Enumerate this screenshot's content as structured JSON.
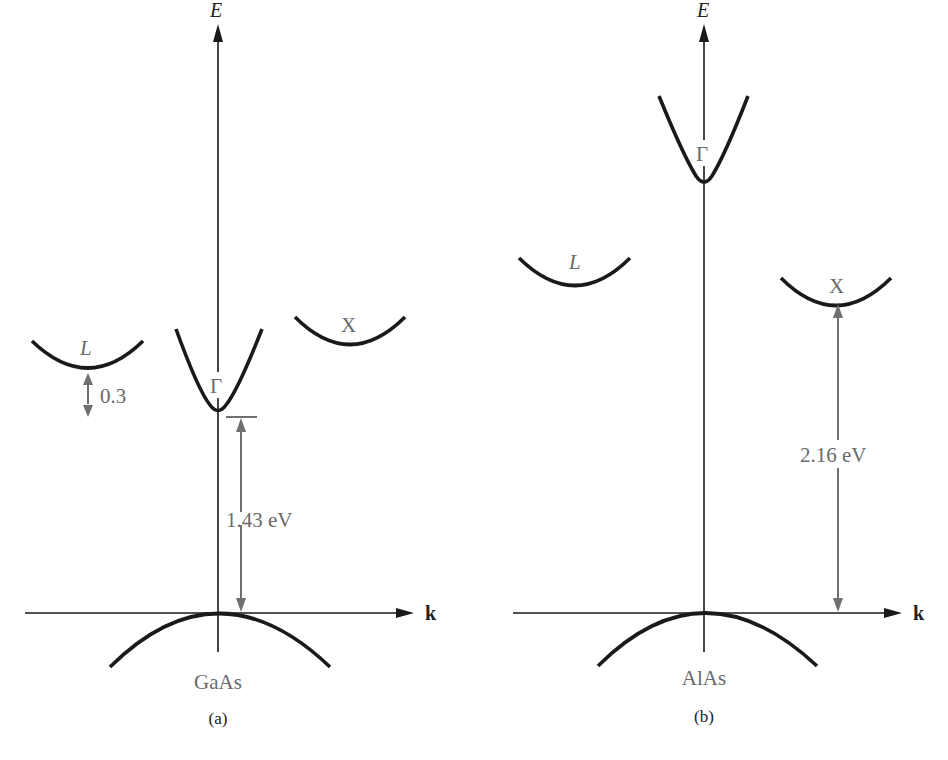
{
  "figure": {
    "panels": [
      {
        "id": "a",
        "caption": "(a)",
        "material": "GaAs",
        "energy_axis_label": "E",
        "k_axis_label": "k",
        "valleys": {
          "L": "L",
          "Gamma": "Γ",
          "X": "X"
        },
        "annotations": {
          "band_gap": "1.43 eV",
          "L_offset": "0.3"
        }
      },
      {
        "id": "b",
        "caption": "(b)",
        "material": "AlAs",
        "energy_axis_label": "E",
        "k_axis_label": "k",
        "valleys": {
          "L": "L",
          "Gamma": "Γ",
          "X": "X"
        },
        "annotations": {
          "band_gap": "2.16 eV"
        }
      }
    ],
    "colors": {
      "curve": "#1a1a1a",
      "annotation": "#707070",
      "label": "#6a6a6a"
    }
  }
}
